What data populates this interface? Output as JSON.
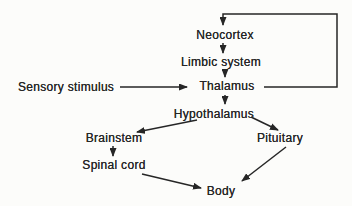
{
  "diagram": {
    "nodes": {
      "sensory_stimulus": {
        "label": "Sensory stimulus"
      },
      "neocortex": {
        "label": "Neocortex"
      },
      "limbic_system": {
        "label": "Limbic system"
      },
      "thalamus": {
        "label": "Thalamus"
      },
      "hypothalamus": {
        "label": "Hypothalamus"
      },
      "brainstem": {
        "label": "Brainstem"
      },
      "pituitary": {
        "label": "Pituitary"
      },
      "spinal_cord": {
        "label": "Spinal cord"
      },
      "body": {
        "label": "Body"
      }
    },
    "edges": [
      {
        "from": "sensory_stimulus",
        "to": "thalamus",
        "shape": "straight"
      },
      {
        "from": "thalamus",
        "to": "neocortex",
        "shape": "elbow-feedback-right"
      },
      {
        "from": "neocortex",
        "to": "limbic_system",
        "shape": "straight"
      },
      {
        "from": "limbic_system",
        "to": "thalamus",
        "shape": "straight"
      },
      {
        "from": "thalamus",
        "to": "hypothalamus",
        "shape": "straight"
      },
      {
        "from": "hypothalamus",
        "to": "brainstem",
        "shape": "straight"
      },
      {
        "from": "hypothalamus",
        "to": "pituitary",
        "shape": "straight"
      },
      {
        "from": "brainstem",
        "to": "spinal_cord",
        "shape": "straight"
      },
      {
        "from": "spinal_cord",
        "to": "body",
        "shape": "straight"
      },
      {
        "from": "pituitary",
        "to": "body",
        "shape": "straight"
      }
    ],
    "colors": {
      "ink": "#262626",
      "background": "#fcfcfa"
    }
  }
}
